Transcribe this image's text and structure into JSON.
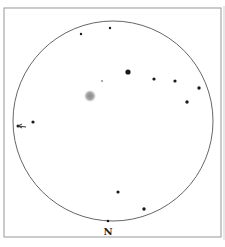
{
  "chart": {
    "type": "telescope-finder-field",
    "frame": {
      "x": 4,
      "y": 8,
      "width": 217,
      "height": 229,
      "color": "#a8a8a8"
    },
    "field_circle": {
      "cx": 113,
      "cy": 121,
      "r": 100,
      "color": "#555555"
    },
    "orientation_label": "N",
    "orientation_label_pos": {
      "x": 108,
      "y": 235
    },
    "object": {
      "name": "fuzzy-object",
      "cx": 90,
      "cy": 96,
      "r": 6,
      "color": "#9a9a9a"
    },
    "stars": [
      {
        "x": 81,
        "y": 34,
        "r": 1.2
      },
      {
        "x": 110,
        "y": 28,
        "r": 1.2
      },
      {
        "x": 128,
        "y": 72,
        "r": 2.6
      },
      {
        "x": 102,
        "y": 81,
        "r": 0.7
      },
      {
        "x": 154,
        "y": 79,
        "r": 1.6
      },
      {
        "x": 175,
        "y": 81,
        "r": 1.6
      },
      {
        "x": 199,
        "y": 88,
        "r": 1.7
      },
      {
        "x": 187,
        "y": 102,
        "r": 1.7
      },
      {
        "x": 33,
        "y": 122,
        "r": 1.6
      },
      {
        "x": 18,
        "y": 126,
        "r": 1.5
      },
      {
        "x": 118,
        "y": 192,
        "r": 1.6
      },
      {
        "x": 144,
        "y": 209,
        "r": 1.7
      },
      {
        "x": 108,
        "y": 221,
        "r": 1.3
      }
    ],
    "direction_arrow": {
      "from": {
        "x": 26,
        "y": 127
      },
      "to": {
        "x": 17,
        "y": 126
      },
      "color": "#333333"
    }
  }
}
